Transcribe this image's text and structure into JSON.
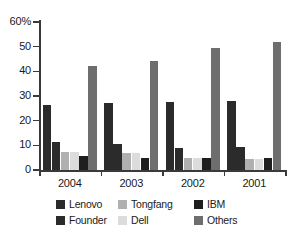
{
  "chart_data": {
    "type": "bar",
    "title": "",
    "subtitle": "",
    "xlabel": "",
    "ylabel": "",
    "ylim": [
      0,
      60
    ],
    "ytick_labels": [
      "60%",
      "50",
      "40",
      "30",
      "20",
      "10",
      "0"
    ],
    "ytick_values": [
      60,
      50,
      40,
      30,
      20,
      10,
      0
    ],
    "grid": false,
    "legend_position": "bottom",
    "categories": [
      "2004",
      "2003",
      "2002",
      "2001"
    ],
    "series": [
      {
        "name": "Lenovo",
        "color": "#2b2b2b",
        "values": [
          26.5,
          27.0,
          27.5,
          28.0
        ]
      },
      {
        "name": "Founder",
        "color": "#2b2b2b",
        "values": [
          11.5,
          10.5,
          9.0,
          9.5
        ]
      },
      {
        "name": "Tongfang",
        "color": "#b0b0b0",
        "values": [
          7.5,
          7.0,
          5.0,
          4.5
        ]
      },
      {
        "name": "Dell",
        "color": "#dcdcdc",
        "values": [
          7.5,
          7.0,
          5.0,
          4.5
        ]
      },
      {
        "name": "IBM",
        "color": "#1e1e1e",
        "values": [
          5.5,
          5.0,
          5.0,
          5.0
        ]
      },
      {
        "name": "Others",
        "color": "#6e6e6e",
        "values": [
          42.0,
          44.0,
          49.5,
          52.0
        ]
      }
    ]
  },
  "legend": {
    "items": [
      {
        "label": "Lenovo",
        "color": "#2b2b2b"
      },
      {
        "label": "Tongfang",
        "color": "#b0b0b0"
      },
      {
        "label": "IBM",
        "color": "#1e1e1e"
      },
      {
        "label": "Founder",
        "color": "#2b2b2b"
      },
      {
        "label": "Dell",
        "color": "#dcdcdc"
      },
      {
        "label": "Others",
        "color": "#6e6e6e"
      }
    ]
  },
  "axis": {
    "y_unit_suffix": "%",
    "x_categories": [
      "2004",
      "2003",
      "2002",
      "2001"
    ]
  }
}
